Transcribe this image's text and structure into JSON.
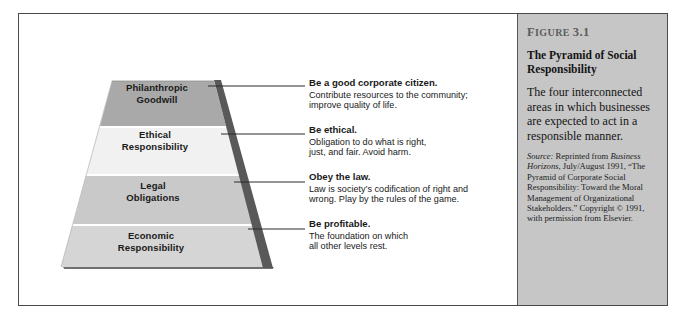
{
  "figure": {
    "number_label": "Figure",
    "number_value": "3.1",
    "number_full": "FIGURE 3.1",
    "title": "The Pyramid of Social Responsibility",
    "body": "The four interconnected areas in which businesses are expected to act in a responsible manner.",
    "source_label": "Source:",
    "source_text_1": " Reprinted from ",
    "source_journal": "Business Horizons",
    "source_text_2": ", July/August 1991, “The Pyramid of Corporate Social Responsibility: Toward the Moral Management of Organizational Stakeholders.” Copyright © 1991, with permission from Elsevier."
  },
  "pyramid": {
    "levels": [
      {
        "id": "philanthropic",
        "label": "Philanthropic\nGoodwill",
        "fill": "#a9a9a9",
        "heading": "Be a good corporate citizen.",
        "body": "Contribute resources to the community;\nimprove quality of life."
      },
      {
        "id": "ethical",
        "label": "Ethical\nResponsibility",
        "fill": "#f1f1f1",
        "heading": "Be ethical.",
        "body": "Obligation to do what is right,\njust, and fair. Avoid harm."
      },
      {
        "id": "legal",
        "label": "Legal\nObligations",
        "fill": "#c9c9c9",
        "heading": "Obey the law.",
        "body": "Law is society’s codification of right and\nwrong. Play by the rules of the game."
      },
      {
        "id": "economic",
        "label": "Economic\nResponsibility",
        "fill": "#d5d5d5",
        "heading": "Be profitable.",
        "body": "The foundation on which\nall other levels rest."
      }
    ]
  },
  "colors": {
    "frame_border": "#4a4a4a",
    "sidebar_bg": "#c6c6c6",
    "pyramid_edge_shadow": "#595959",
    "figure_number_text": "#5d5d5d",
    "leader_line": "#2b2b2b"
  }
}
